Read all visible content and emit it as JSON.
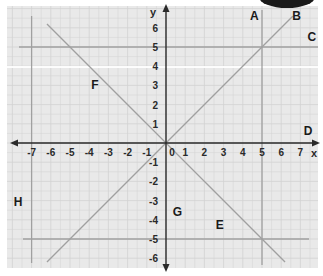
{
  "diagram": {
    "type": "coordinate-plane",
    "x_axis": {
      "label": "x",
      "ticks": [
        "-7",
        "-6",
        "-5",
        "-4",
        "-3",
        "-2",
        "-1",
        "0",
        "1",
        "2",
        "3",
        "4",
        "5",
        "6",
        "7"
      ]
    },
    "y_axis": {
      "label": "y",
      "ticks": [
        "6",
        "5",
        "4",
        "3",
        "2",
        "1",
        "-1",
        "-2",
        "-3",
        "-4",
        "-5",
        "-6"
      ]
    },
    "lines": [
      {
        "id": "A",
        "label": "A",
        "description": "vertical line x = 5"
      },
      {
        "id": "B",
        "label": "B",
        "description": "line y = x"
      },
      {
        "id": "C",
        "label": "C",
        "description": "horizontal line y = 5"
      },
      {
        "id": "D",
        "label": "D",
        "description": "x-axis (y = 0)"
      },
      {
        "id": "E",
        "label": "E",
        "description": "horizontal line y = -5"
      },
      {
        "id": "F",
        "label": "F",
        "description": "line y = -x"
      },
      {
        "id": "G",
        "label": "G",
        "description": "y-axis (x = 0)"
      },
      {
        "id": "H",
        "label": "H",
        "description": "vertical line x = -7"
      }
    ],
    "colors": {
      "background": "#e9e9e9",
      "grid": "#d2d2d2",
      "line": "#a0a0a0",
      "axis": "#2a2a2a",
      "text": "#1a1a1a"
    }
  }
}
